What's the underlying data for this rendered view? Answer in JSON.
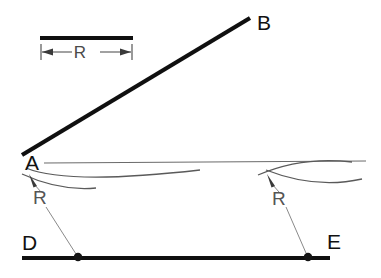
{
  "figure": {
    "background_color": "#ffffff",
    "ink_color": "#101010",
    "thin_color": "#6b6b6b",
    "labels": {
      "point_a": "A",
      "point_b": "B",
      "point_d": "D",
      "point_e": "E",
      "radius_left": "R",
      "radius_right": "R",
      "radius_scale": "R"
    },
    "scale_bar": {
      "label": "R",
      "bar_x1": 40,
      "bar_x2": 133,
      "bar_y": 38,
      "dim_y": 52,
      "tick_top": 44,
      "tick_bottom": 60
    },
    "geometry": {
      "line_ab": {
        "x1": 22,
        "y1": 155,
        "x2": 250,
        "y2": 18
      },
      "line_de": {
        "x1": 22,
        "y1": 258,
        "x2": 330,
        "y2": 258
      },
      "horizontal_ref": {
        "x1": 44,
        "y1": 163,
        "x2": 366,
        "y2": 161
      },
      "left_center_dot": {
        "cx": 78,
        "cy": 258,
        "r": 4.2
      },
      "right_center_dot": {
        "cx": 308,
        "cy": 257,
        "r": 4.2
      },
      "left_arc": "M 26 168 C 60 182 130 178 200 170",
      "left_arc_tail": "M 22 174 C 48 186 74 190 96 188",
      "right_arc": "M 258 175 C 286 163 318 158 352 162",
      "right_arc_tail": "M 266 170 C 292 180 324 186 360 180",
      "left_arrow_tip": {
        "x": 29,
        "y": 174
      },
      "right_arrow_tip": {
        "x": 267,
        "y": 174
      },
      "left_leader": {
        "x1": 34,
        "y1": 183,
        "x2": 40,
        "y2": 191
      },
      "left_leader_lower": {
        "x1": 46,
        "y1": 205,
        "x2": 76,
        "y2": 254
      },
      "right_leader": {
        "x1": 272,
        "y1": 183,
        "x2": 278,
        "y2": 191
      },
      "right_leader_lower": {
        "x1": 285,
        "y1": 205,
        "x2": 306,
        "y2": 253
      }
    },
    "label_positions": {
      "a": {
        "x": 25,
        "y": 170
      },
      "b": {
        "x": 257,
        "y": 30
      },
      "d": {
        "x": 22,
        "y": 250
      },
      "e": {
        "x": 327,
        "y": 249
      },
      "r_left": {
        "x": 33,
        "y": 204
      },
      "r_right": {
        "x": 272,
        "y": 205
      },
      "r_scale": {
        "x": 80,
        "y": 58
      }
    }
  }
}
